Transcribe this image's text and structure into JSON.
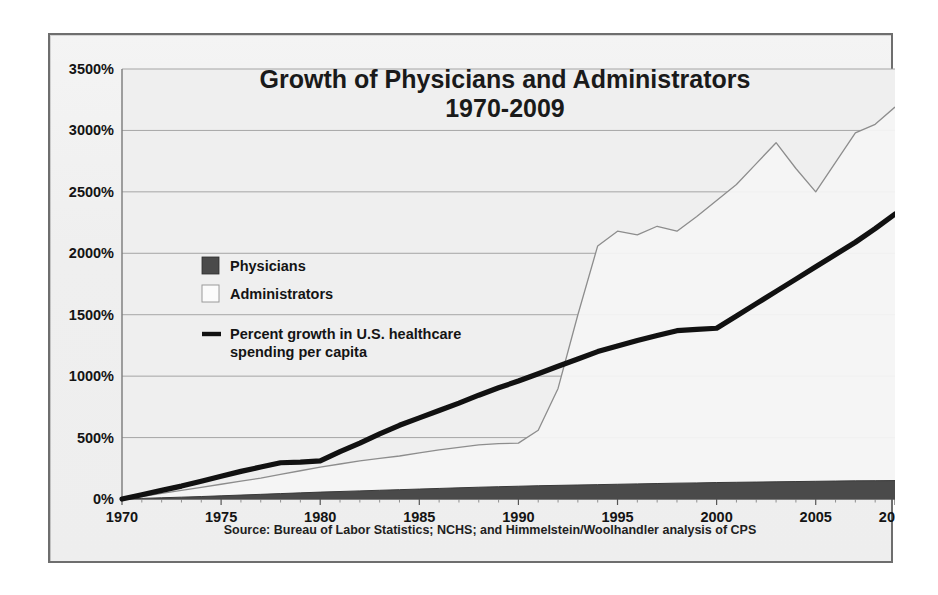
{
  "figure": {
    "source_note": "Source: Bureau of Labor Statistics; NCHS; and Himmelstein/Woolhandler analysis of CPS",
    "frame_color": "#6e6e6e",
    "background_color": "#eeeeee"
  },
  "chart_data": {
    "type": "area",
    "title": "Growth of Physicians and Administrators",
    "subtitle": "1970-2009",
    "xlabel": "",
    "ylabel": "",
    "xlim": [
      1970,
      2009
    ],
    "ylim": [
      0,
      3500
    ],
    "grid": true,
    "legend_position": "center-left",
    "y_ticks": [
      "0%",
      "500%",
      "1000%",
      "1500%",
      "2000%",
      "2500%",
      "3000%",
      "3500%"
    ],
    "y_tick_values": [
      0,
      500,
      1000,
      1500,
      2000,
      2500,
      3000,
      3500
    ],
    "x_ticks": [
      "1970",
      "1975",
      "1980",
      "1985",
      "1990",
      "1995",
      "2000",
      "2005",
      "2009"
    ],
    "x_tick_values": [
      1970,
      1975,
      1980,
      1985,
      1990,
      1995,
      2000,
      2005,
      2009
    ],
    "x": [
      1970,
      1971,
      1972,
      1973,
      1974,
      1975,
      1976,
      1977,
      1978,
      1979,
      1980,
      1981,
      1982,
      1983,
      1984,
      1985,
      1986,
      1987,
      1988,
      1989,
      1990,
      1991,
      1992,
      1993,
      1994,
      1995,
      1996,
      1997,
      1998,
      1999,
      2000,
      2001,
      2002,
      2003,
      2004,
      2005,
      2006,
      2007,
      2008,
      2009
    ],
    "series": [
      {
        "name": "Administrators",
        "kind": "area",
        "fill": "#f4f4f4",
        "line": "#8d8d8d",
        "values": [
          0,
          20,
          45,
          70,
          95,
          120,
          145,
          170,
          200,
          230,
          260,
          285,
          310,
          330,
          350,
          375,
          400,
          420,
          440,
          450,
          455,
          560,
          900,
          1500,
          2060,
          2180,
          2150,
          2220,
          2180,
          2300,
          2430,
          2560,
          2730,
          2900,
          2690,
          2500,
          2740,
          2980,
          3050,
          3190
        ]
      },
      {
        "name": "Physicians",
        "kind": "area",
        "fill": "#4a4a4a",
        "line": "#3a3a3a",
        "values": [
          0,
          5,
          10,
          15,
          20,
          26,
          32,
          38,
          44,
          50,
          56,
          61,
          66,
          71,
          76,
          81,
          86,
          91,
          96,
          100,
          104,
          108,
          111,
          114,
          117,
          120,
          123,
          126,
          129,
          131,
          134,
          136,
          138,
          140,
          142,
          144,
          146,
          148,
          149,
          150
        ]
      },
      {
        "name": "Percent growth in U.S. healthcare spending per capita",
        "kind": "line",
        "line": "#111111",
        "values": [
          0,
          35,
          70,
          105,
          145,
          185,
          225,
          260,
          295,
          300,
          310,
          385,
          455,
          530,
          600,
          660,
          720,
          780,
          845,
          905,
          960,
          1020,
          1080,
          1140,
          1200,
          1245,
          1290,
          1330,
          1370,
          1380,
          1390,
          1490,
          1590,
          1690,
          1790,
          1890,
          1990,
          2090,
          2200,
          2320
        ]
      }
    ],
    "legend": [
      {
        "label": "Physicians",
        "marker": "filled-square",
        "color": "#4a4a4a"
      },
      {
        "label": "Administrators",
        "marker": "open-square",
        "color": "#fafafa"
      },
      {
        "label": "Percent growth in U.S. healthcare",
        "label_line2": "spending per capita",
        "marker": "line",
        "color": "#111111"
      }
    ]
  }
}
